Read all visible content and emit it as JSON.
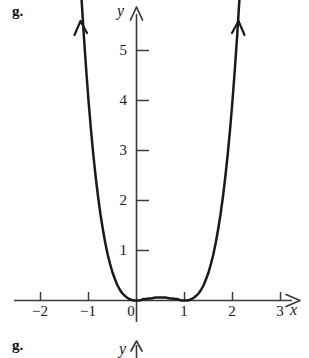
{
  "figure": {
    "part_label": "g.",
    "next_part_label": "g.",
    "x_axis_letter": "x",
    "y_axis_letter": "y",
    "next_y_axis_letter": "y",
    "line_color": "#1a1a1a",
    "axis_color": "#3a3a3a",
    "background_color": "#ffffff"
  },
  "chart_data": {
    "type": "line",
    "title": "",
    "xlabel": "x",
    "ylabel": "y",
    "xlim": [
      -2.5,
      3.4
    ],
    "ylim": [
      -0.35,
      5.8
    ],
    "xticks": [
      -2,
      -1,
      0,
      1,
      2,
      3
    ],
    "yticks": [
      1,
      2,
      3,
      4,
      5
    ],
    "xtick_labels": [
      "−2",
      "−1",
      "0",
      "1",
      "2",
      "3"
    ],
    "ytick_labels": [
      "1",
      "2",
      "3",
      "4",
      "5"
    ],
    "grid": false,
    "legend": null,
    "annotations": [
      "g."
    ],
    "series": [
      {
        "name": "y = x^2(x-1)^2",
        "x": [
          -1.15,
          -1.1,
          -1.05,
          -1.0,
          -0.95,
          -0.9,
          -0.85,
          -0.8,
          -0.75,
          -0.7,
          -0.65,
          -0.6,
          -0.55,
          -0.5,
          -0.45,
          -0.4,
          -0.35,
          -0.3,
          -0.25,
          -0.2,
          -0.15,
          -0.1,
          -0.05,
          0.0,
          0.05,
          0.1,
          0.15,
          0.2,
          0.25,
          0.3,
          0.35,
          0.4,
          0.45,
          0.5,
          0.55,
          0.6,
          0.65,
          0.7,
          0.75,
          0.8,
          0.85,
          0.9,
          0.95,
          1.0,
          1.05,
          1.1,
          1.15,
          1.2,
          1.25,
          1.3,
          1.35,
          1.4,
          1.45,
          1.5,
          1.55,
          1.6,
          1.65,
          1.7,
          1.75,
          1.8,
          1.85,
          1.9,
          1.95,
          2.0,
          2.05,
          2.1,
          2.15
        ],
        "y": [
          6.11,
          5.34,
          4.64,
          4.0,
          3.43,
          2.92,
          2.47,
          2.07,
          1.72,
          1.42,
          1.15,
          0.92,
          0.73,
          0.56,
          0.43,
          0.31,
          0.22,
          0.15,
          0.1,
          0.06,
          0.03,
          0.01,
          0.0,
          0.0,
          0.0,
          0.01,
          0.03,
          0.03,
          0.04,
          0.04,
          0.05,
          0.06,
          0.06,
          0.06,
          0.06,
          0.06,
          0.05,
          0.04,
          0.04,
          0.03,
          0.03,
          0.01,
          0.0,
          0.0,
          0.0,
          0.01,
          0.03,
          0.06,
          0.1,
          0.15,
          0.22,
          0.31,
          0.43,
          0.56,
          0.73,
          0.92,
          1.15,
          1.42,
          1.72,
          2.07,
          2.47,
          2.92,
          3.43,
          4.0,
          4.64,
          5.34,
          6.11
        ]
      }
    ]
  }
}
